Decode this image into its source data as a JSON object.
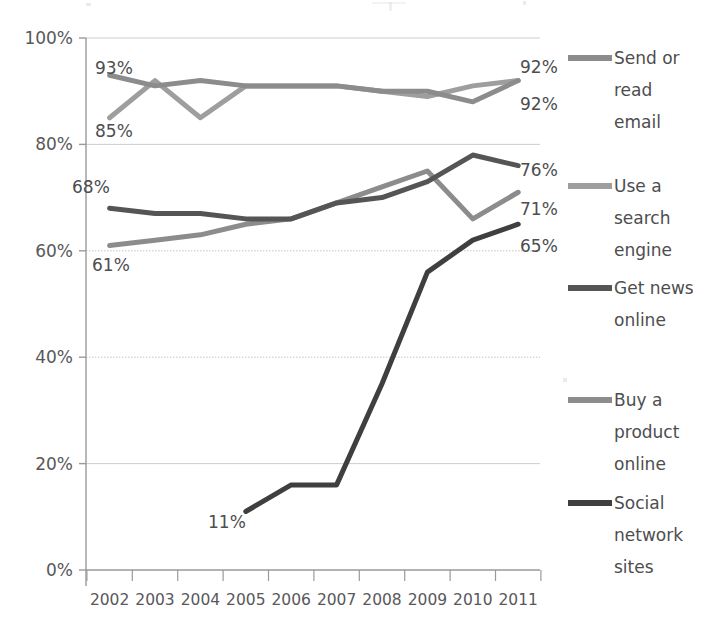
{
  "chart_data": {
    "type": "line",
    "title": "",
    "subtitle": "",
    "xlabel": "",
    "ylabel": "",
    "x": [
      2002,
      2003,
      2004,
      2005,
      2006,
      2007,
      2008,
      2009,
      2010,
      2011
    ],
    "categories": [
      "2002",
      "2003",
      "2004",
      "2005",
      "2006",
      "2007",
      "2008",
      "2009",
      "2010",
      "2011"
    ],
    "ylim": [
      0,
      100
    ],
    "ytick_labels": [
      "0%",
      "20%",
      "40%",
      "60%",
      "80%",
      "100%"
    ],
    "ytick_values": [
      0,
      20,
      40,
      60,
      80,
      100
    ],
    "grid": true,
    "legend_position": "right",
    "series": [
      {
        "name": "Send or read email",
        "color": "#8c8c8c",
        "width": 5,
        "values": [
          93,
          91,
          92,
          91,
          91,
          91,
          90,
          90,
          88,
          92
        ],
        "start_label": "93%",
        "end_label": "92%"
      },
      {
        "name": "Use a search engine",
        "color": "#9e9e9e",
        "width": 5,
        "values": [
          85,
          92,
          85,
          91,
          91,
          91,
          90,
          89,
          91,
          92
        ],
        "start_label": "85%",
        "end_label": "92%"
      },
      {
        "name": "Get news online",
        "color": "#555555",
        "width": 5,
        "values": [
          68,
          67,
          67,
          66,
          66,
          69,
          70,
          73,
          78,
          76
        ],
        "start_label": "68%",
        "end_label": "76%"
      },
      {
        "name": "Buy a product online",
        "color": "#8c8c8c",
        "width": 5,
        "values": [
          61,
          62,
          63,
          65,
          66,
          69,
          72,
          75,
          66,
          71
        ],
        "start_label": "61%",
        "end_label": "71%"
      },
      {
        "name": "Social network sites",
        "color": "#3f3f3f",
        "width": 5,
        "values": [
          null,
          null,
          null,
          11,
          16,
          16,
          35,
          56,
          62,
          65
        ],
        "start_label": "11%",
        "end_label": "65%"
      }
    ],
    "value_labels_left": [
      {
        "text": "93%",
        "series": "Send or read email"
      },
      {
        "text": "85%",
        "series": "Use a search engine"
      },
      {
        "text": "68%",
        "series": "Get news online"
      },
      {
        "text": "61%",
        "series": "Buy a product online"
      },
      {
        "text": "11%",
        "series": "Social network sites"
      }
    ],
    "value_labels_right": [
      {
        "text": "92%",
        "series": "Send or read email"
      },
      {
        "text": "92%",
        "series": "Use a search engine"
      },
      {
        "text": "76%",
        "series": "Get news online"
      },
      {
        "text": "71%",
        "series": "Buy a product online"
      },
      {
        "text": "65%",
        "series": "Social network sites"
      }
    ]
  },
  "legend": {
    "items": [
      {
        "label_line1": "Send or",
        "label_line2": "read",
        "label_line3": "email",
        "color": "#8c8c8c"
      },
      {
        "label_line1": "Use a",
        "label_line2": "search",
        "label_line3": "engine",
        "color": "#9e9e9e"
      },
      {
        "label_line1": "Get news",
        "label_line2": "online",
        "label_line3": "",
        "color": "#555555"
      },
      {
        "label_line1": "Buy a",
        "label_line2": "product",
        "label_line3": "online",
        "color": "#8c8c8c"
      },
      {
        "label_line1": "Social",
        "label_line2": "network",
        "label_line3": "sites",
        "color": "#3f3f3f"
      }
    ]
  },
  "axis": {
    "y_labels": [
      "100%",
      "80%",
      "60%",
      "40%",
      "20%",
      "0%"
    ],
    "x_labels": [
      "2002",
      "2003",
      "2004",
      "2005",
      "2006",
      "2007",
      "2008",
      "2009",
      "2010",
      "2011"
    ]
  },
  "colors": {
    "grid": "#bdbdbd",
    "axis": "#9a9a9a",
    "text": "#4d4d4f",
    "background": "#ffffff"
  }
}
